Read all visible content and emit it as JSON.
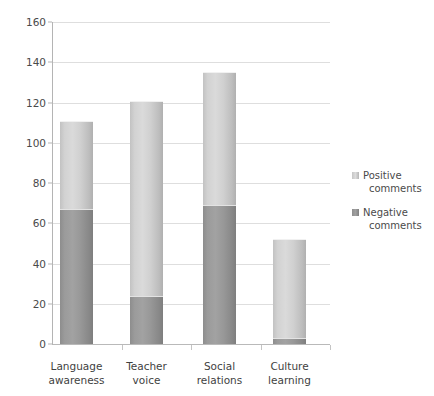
{
  "chart_data": {
    "type": "bar",
    "subtype": "stacked-column",
    "title": "",
    "xlabel": "",
    "ylabel": "",
    "categories": [
      "Language awareness",
      "Teacher voice",
      "Social relations",
      "Culture learning"
    ],
    "category_lines": [
      [
        "Language",
        "awareness"
      ],
      [
        "Teacher",
        "voice"
      ],
      [
        "Social",
        "relations"
      ],
      [
        "Culture",
        "learning"
      ]
    ],
    "series": [
      {
        "name": "Negative comments",
        "color": "#979797",
        "values": [
          67,
          24,
          69,
          3
        ]
      },
      {
        "name": "Positive comments",
        "color": "#d4d4d4",
        "values": [
          44,
          97,
          66,
          49
        ]
      }
    ],
    "totals": [
      111,
      121,
      135,
      52
    ],
    "ylim": [
      0,
      160
    ],
    "ytick_values": [
      0,
      20,
      40,
      60,
      80,
      100,
      120,
      140,
      160
    ],
    "ytick_labels": [
      "0",
      "20",
      "40",
      "60",
      "80",
      "100",
      "120",
      "140",
      "160"
    ],
    "grid": true,
    "grid_axis": "y",
    "legend_position": "right",
    "legend_entries": [
      {
        "label_lines": [
          "Positive",
          "comments"
        ],
        "swatch": "positive"
      },
      {
        "label_lines": [
          "Negative",
          "comments"
        ],
        "swatch": "negative"
      }
    ]
  }
}
